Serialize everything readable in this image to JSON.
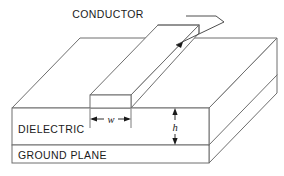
{
  "figure": {
    "title_alt": "Microstrip transmission line structure",
    "labels": {
      "conductor": "CONDUCTOR",
      "dielectric": "DIELECTRIC",
      "ground_plane": "GROUND PLANE",
      "width_symbol": "w",
      "height_symbol": "h"
    },
    "colors": {
      "background": "#ffffff",
      "edge_stroke": "#6e6e6e",
      "text": "#1a1a1a",
      "dimension_stroke": "#1a1a1a"
    },
    "annotations": {
      "conductor_leader": "leader-line-to-conductor-top-face",
      "width_dimension": "horizontal-double-arrow-across-conductor-front-face",
      "height_dimension": "vertical-double-arrow-across-dielectric-front-face"
    },
    "geometry": {
      "view": "isometric-cutaway",
      "slab_front_top_y": 108,
      "slab_front_bottom_y": 163,
      "ground_plane_divider_y": 145,
      "slab_left_x": 12,
      "slab_front_right_x": 209,
      "depth_offset_x": 68,
      "depth_offset_y": 70,
      "conductor_front_left_x": 90,
      "conductor_front_right_x": 131,
      "conductor_top_y": 95
    }
  }
}
